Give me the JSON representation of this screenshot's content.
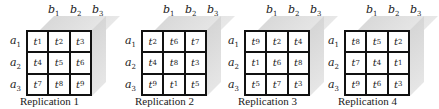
{
  "diagram": {
    "column_labels": [
      "b1",
      "b2",
      "b3"
    ],
    "row_labels": [
      "a1",
      "a2",
      "a3"
    ],
    "replications": [
      {
        "caption": "Replication 1",
        "cells": [
          [
            "t1",
            "t2",
            "t3"
          ],
          [
            "t4",
            "t5",
            "t6"
          ],
          [
            "t7",
            "t8",
            "t9"
          ]
        ]
      },
      {
        "caption": "Replication 2",
        "cells": [
          [
            "t2",
            "t6",
            "t7"
          ],
          [
            "t4",
            "t8",
            "t3"
          ],
          [
            "t9",
            "t1",
            "t5"
          ]
        ]
      },
      {
        "caption": "Replication 3",
        "cells": [
          [
            "t9",
            "t2",
            "t4"
          ],
          [
            "t1",
            "t6",
            "t8"
          ],
          [
            "t5",
            "t7",
            "t3"
          ]
        ]
      },
      {
        "caption": "Replication 4",
        "cells": [
          [
            "t8",
            "t5",
            "t2"
          ],
          [
            "t7",
            "t4",
            "t1"
          ],
          [
            "t9",
            "t6",
            "t3"
          ]
        ]
      }
    ],
    "colors": {
      "face": "#e0e0e0",
      "grid_line": "#111111",
      "background": "#ffffff"
    }
  }
}
